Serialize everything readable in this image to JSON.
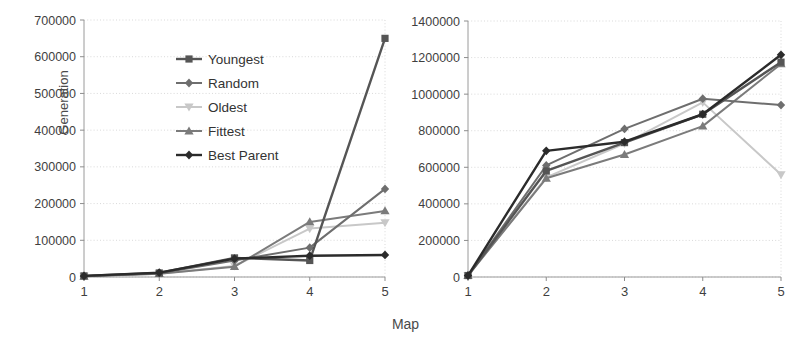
{
  "figure": {
    "xlabel": "Map",
    "ylabel": "Generation"
  },
  "legend": {
    "position": "inside-left-panel-top",
    "entries": [
      {
        "label": "Youngest",
        "marker": "square",
        "color": "#555555"
      },
      {
        "label": "Random",
        "marker": "diamond",
        "color": "#6e6e6e"
      },
      {
        "label": "Oldest",
        "marker": "triangle-down",
        "color": "#c8c8c8"
      },
      {
        "label": "Fittest",
        "marker": "triangle-up",
        "color": "#7b7b7b"
      },
      {
        "label": "Best Parent",
        "marker": "diamond",
        "color": "#2b2b2b"
      }
    ]
  },
  "chart_data": [
    {
      "type": "line",
      "title": "",
      "xlabel": "Map",
      "ylabel": "Generation",
      "grid": true,
      "legend": "inside top-left",
      "categories": [
        "1",
        "2",
        "3",
        "4",
        "5"
      ],
      "x": [
        1,
        2,
        3,
        4,
        5
      ],
      "xlim": [
        1,
        5
      ],
      "ylim": [
        0,
        700000
      ],
      "yticks": [
        0,
        100000,
        200000,
        300000,
        400000,
        500000,
        600000,
        700000
      ],
      "yticklabels": [
        "0",
        "100000",
        "200000",
        "300000",
        "400000",
        "500000",
        "600000",
        "700000"
      ],
      "xticklabels": [
        "1",
        "2",
        "3",
        "4",
        "5"
      ],
      "series": [
        {
          "name": "Youngest",
          "marker": "square",
          "color": "#555555",
          "values": [
            3000,
            11000,
            52000,
            45000,
            650000
          ]
        },
        {
          "name": "Random",
          "marker": "diamond",
          "color": "#6e6e6e",
          "values": [
            2000,
            10000,
            45000,
            80000,
            240000
          ]
        },
        {
          "name": "Oldest",
          "marker": "triangle-down",
          "color": "#c8c8c8",
          "values": [
            2000,
            9000,
            30000,
            132000,
            148000
          ]
        },
        {
          "name": "Fittest",
          "marker": "triangle-up",
          "color": "#7b7b7b",
          "values": [
            2000,
            9000,
            28000,
            150000,
            180000
          ]
        },
        {
          "name": "Best Parent",
          "marker": "diamond",
          "color": "#2b2b2b",
          "values": [
            3000,
            12000,
            50000,
            58000,
            60000
          ]
        }
      ]
    },
    {
      "type": "line",
      "title": "",
      "xlabel": "Map",
      "ylabel": "",
      "grid": true,
      "legend": "none",
      "categories": [
        "1",
        "2",
        "3",
        "4",
        "5"
      ],
      "x": [
        1,
        2,
        3,
        4,
        5
      ],
      "xlim": [
        1,
        5
      ],
      "ylim": [
        0,
        1400000
      ],
      "yticks": [
        0,
        200000,
        400000,
        600000,
        800000,
        1000000,
        1200000,
        1400000
      ],
      "yticklabels": [
        "0",
        "200000",
        "400000",
        "600000",
        "800000",
        "1000000",
        "1200000",
        "1400000"
      ],
      "xticklabels": [
        "1",
        "2",
        "3",
        "4",
        "5"
      ],
      "series": [
        {
          "name": "Youngest",
          "marker": "square",
          "color": "#555555",
          "values": [
            8000,
            580000,
            735000,
            890000,
            1175000
          ]
        },
        {
          "name": "Random",
          "marker": "diamond",
          "color": "#6e6e6e",
          "values": [
            8000,
            610000,
            810000,
            975000,
            940000
          ]
        },
        {
          "name": "Oldest",
          "marker": "triangle-down",
          "color": "#c8c8c8",
          "values": [
            8000,
            545000,
            730000,
            955000,
            560000
          ]
        },
        {
          "name": "Fittest",
          "marker": "triangle-up",
          "color": "#7b7b7b",
          "values": [
            8000,
            540000,
            670000,
            825000,
            1165000
          ]
        },
        {
          "name": "Best Parent",
          "marker": "diamond",
          "color": "#2b2b2b",
          "values": [
            8000,
            690000,
            740000,
            890000,
            1215000
          ]
        }
      ]
    }
  ]
}
